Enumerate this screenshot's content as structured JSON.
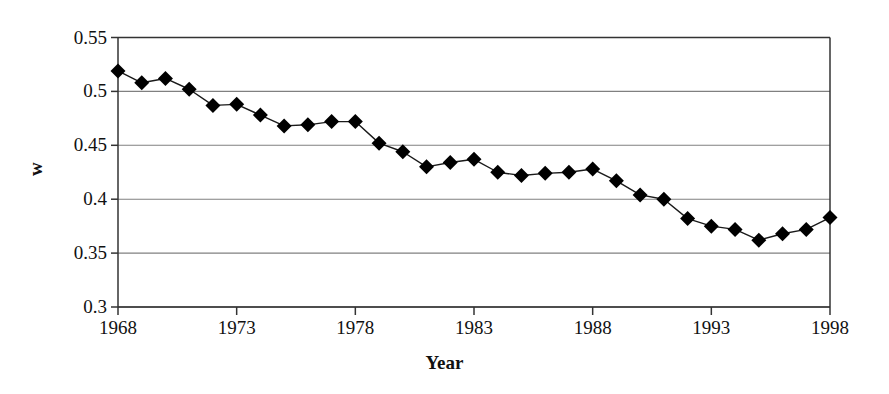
{
  "chart_data": {
    "type": "line",
    "title": "",
    "xlabel": "Year",
    "ylabel": "w",
    "xlim": [
      1968,
      1998
    ],
    "ylim": [
      0.3,
      0.55
    ],
    "grid": "horizontal",
    "legend": "none",
    "marker": "filled-diamond",
    "x_tick_labels": [
      "1968",
      "1973",
      "1978",
      "1983",
      "1988",
      "1993",
      "1998"
    ],
    "x_ticks": [
      1968,
      1973,
      1978,
      1983,
      1988,
      1993,
      1998
    ],
    "y_tick_labels": [
      "0.3",
      "0.35",
      "0.4",
      "0.45",
      "0.5",
      "0.55"
    ],
    "y_ticks": [
      0.3,
      0.35,
      0.4,
      0.45,
      0.5,
      0.55
    ],
    "x": [
      1968,
      1969,
      1970,
      1971,
      1972,
      1973,
      1974,
      1975,
      1976,
      1977,
      1978,
      1979,
      1980,
      1981,
      1982,
      1983,
      1984,
      1985,
      1986,
      1987,
      1988,
      1989,
      1990,
      1991,
      1992,
      1993,
      1994,
      1995,
      1996,
      1997,
      1998
    ],
    "values": [
      0.519,
      0.508,
      0.512,
      0.502,
      0.487,
      0.488,
      0.478,
      0.468,
      0.469,
      0.472,
      0.472,
      0.452,
      0.444,
      0.43,
      0.434,
      0.437,
      0.425,
      0.422,
      0.424,
      0.425,
      0.428,
      0.417,
      0.404,
      0.4,
      0.382,
      0.375,
      0.372,
      0.362,
      0.368,
      0.372,
      0.383
    ],
    "series_name": "w",
    "line_color": "#1a1a1a",
    "marker_color": "#000000",
    "grid_color": "#808080",
    "axis_color": "#333333",
    "background_color": "#ffffff"
  }
}
